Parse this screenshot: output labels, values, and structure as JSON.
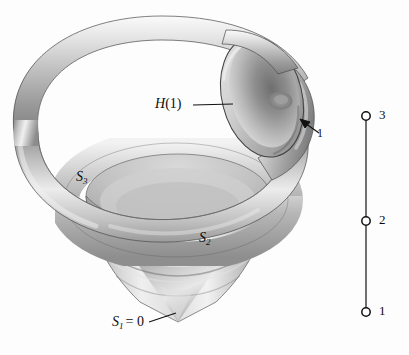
{
  "figure": {
    "background_color": "#fdfdfd",
    "ink_color": "#0d0d0d"
  },
  "labels": {
    "handle": {
      "name": "H(1)",
      "letter": "H",
      "arg": "(1)"
    },
    "index_one": "1",
    "s3": {
      "base": "S",
      "sub": "3"
    },
    "s2": {
      "base": "S",
      "sub": "2"
    },
    "s1": {
      "base": "S",
      "sub": "1",
      "equals": "= 0"
    },
    "node3": "3",
    "node2": "2",
    "node1": "1"
  },
  "axis_diagram": {
    "orientation": "vertical",
    "line_x": 366,
    "top_y": 116,
    "bottom_y": 312,
    "nodes": [
      {
        "label": "3",
        "y": 116
      },
      {
        "label": "2",
        "y": 221
      },
      {
        "label": "1",
        "y": 312
      }
    ],
    "node_style": "open-circle"
  },
  "leaders": [
    {
      "name": "h-leader",
      "from": [
        193,
        105
      ],
      "to": [
        233,
        105
      ]
    },
    {
      "name": "one-arrow",
      "from": [
        318,
        133
      ],
      "to": [
        300,
        120
      ]
    },
    {
      "name": "s1-leader",
      "from": [
        150,
        322
      ],
      "to": [
        177,
        312
      ]
    }
  ],
  "colors": {
    "tube_highlight": "#f4f4f4",
    "tube_mid": "#c9c9c9",
    "tube_shadow": "#8a8a8a",
    "tube_dark": "#6e6e6e",
    "cut_face_light": "#d8d8d8",
    "cut_face_dark": "#7c7c7c",
    "vase_light": "#ededed",
    "vase_mid": "#bdbdbd",
    "vase_shadow": "#8f8f8f",
    "outline": "#3a3a3a"
  },
  "geometry": {
    "outer_torus": {
      "cx": 160,
      "cy": 110,
      "rx": 150,
      "ry": 88,
      "tube": 26
    },
    "inner_torus": {
      "cx": 175,
      "cy": 200,
      "rx": 112,
      "ry": 56,
      "tube": 17
    },
    "vase": {
      "cx": 178,
      "top_y": 186,
      "apex_y": 320,
      "half_width": 92
    },
    "cut_ellipse": {
      "cx": 262,
      "cy": 97,
      "rx": 38,
      "ry": 60,
      "rotation": -14
    }
  }
}
